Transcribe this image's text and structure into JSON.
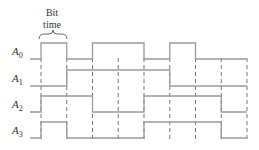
{
  "annotation": {
    "line1": "Bit",
    "line2": "time"
  },
  "signals": [
    {
      "name": "A",
      "sub": "0",
      "bits": [
        1,
        0,
        1,
        1,
        0,
        1,
        0,
        0
      ]
    },
    {
      "name": "A",
      "sub": "1",
      "bits": [
        0,
        1,
        1,
        1,
        1,
        0,
        0,
        0
      ]
    },
    {
      "name": "A",
      "sub": "2",
      "bits": [
        1,
        1,
        0,
        0,
        1,
        1,
        1,
        0
      ]
    },
    {
      "name": "A",
      "sub": "3",
      "bits": [
        1,
        0,
        0,
        0,
        1,
        1,
        1,
        0
      ]
    }
  ],
  "colors": {
    "waveform": "#9a9a9a",
    "dash": "#555555",
    "text": "#333333"
  }
}
